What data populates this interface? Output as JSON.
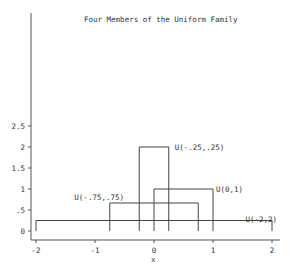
{
  "chart_data": {
    "type": "line",
    "title": "Four Members of the Uniform Family",
    "xlabel": "x",
    "ylabel": "",
    "xlim": [
      -2,
      2
    ],
    "ylim": [
      0,
      2.5
    ],
    "grid": false,
    "legend": "none (series labeled inline)",
    "x_ticks": [
      -2,
      -1,
      0,
      1,
      2
    ],
    "x_tick_labels": [
      "-2",
      "-1",
      "0",
      "1",
      "2"
    ],
    "y_ticks": [
      0,
      0.5,
      1,
      1.5,
      2,
      2.5
    ],
    "y_tick_labels": [
      "0",
      ".5",
      "1",
      "1.5",
      "2",
      "2.5"
    ],
    "series": [
      {
        "name": "U(-.25,.25)",
        "a": -0.25,
        "b": 0.25,
        "density": 2.0,
        "label_pos": [
          0.35,
          2.0
        ]
      },
      {
        "name": "U(0,1)",
        "a": 0,
        "b": 1,
        "density": 1.0,
        "label_pos": [
          1.05,
          1.0
        ]
      },
      {
        "name": "U(-.75,.75)",
        "a": -0.75,
        "b": 0.75,
        "density": 0.6667,
        "label_pos": [
          -1.35,
          0.8
        ]
      },
      {
        "name": "U(-2,2)",
        "a": -2,
        "b": 2,
        "density": 0.25,
        "label_pos": [
          1.55,
          0.28
        ]
      }
    ]
  }
}
